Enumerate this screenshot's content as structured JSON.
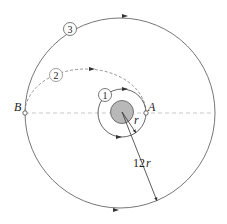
{
  "diagram": {
    "type": "orbital-transfer",
    "points": {
      "A": "A",
      "B": "B"
    },
    "orbits": [
      {
        "id": "1",
        "label": "1",
        "style": "solid",
        "description": "inner circular orbit"
      },
      {
        "id": "2",
        "label": "2",
        "style": "dashed",
        "description": "transfer ellipse from A to B"
      },
      {
        "id": "3",
        "label": "3",
        "style": "solid",
        "description": "outer circular orbit"
      }
    ],
    "dimensions": {
      "inner_radius_label": "r",
      "outer_radius_label_num": "12",
      "outer_radius_label_var": "r"
    },
    "colors": {
      "line": "#555555",
      "planet_fill": "#b8b8b8",
      "planet_stroke": "#666666",
      "dashed": "#8a8a8a"
    }
  }
}
